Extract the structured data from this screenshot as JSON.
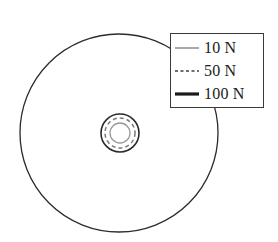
{
  "figure": {
    "background_color": "#ffffff",
    "width": 278,
    "height": 242
  },
  "disc": {
    "name": "outer-disc",
    "center_x": 119,
    "center_y": 133,
    "radius": 99,
    "stroke_color": "#2b2b2b",
    "stroke_width": 1.3,
    "fill": "none"
  },
  "hub": {
    "name": "center-hub",
    "center_x": 120,
    "center_y": 133,
    "rings": [
      {
        "label": "hub-outer-ring",
        "radius": 19,
        "stroke_color": "#2b2b2b",
        "stroke_width": 1.6,
        "dash": "none"
      },
      {
        "label": "hub-dashed-ring",
        "radius": 15,
        "stroke_color": "#7a7a7a",
        "stroke_width": 1.5,
        "dash": "4 3"
      },
      {
        "label": "hub-inner-ring",
        "radius": 10,
        "stroke_color": "#9a9a9a",
        "stroke_width": 1.3,
        "dash": "none"
      }
    ]
  },
  "legend": {
    "name": "force-legend",
    "border_color": "#3a3a3a",
    "background_color": "#ffffff",
    "x": 170,
    "y": 33,
    "width": 94,
    "height": 75,
    "entries": [
      {
        "label": "10 N",
        "value": 10,
        "unit": "N",
        "style": "solid-thin",
        "color": "#8c8c8c",
        "stroke_width": 1.5,
        "dash": "none"
      },
      {
        "label": "50 N",
        "value": 50,
        "unit": "N",
        "style": "dotted",
        "color": "#6f6f6f",
        "stroke_width": 2,
        "dash": "3 2.5"
      },
      {
        "label": "100 N",
        "value": 100,
        "unit": "N",
        "style": "solid-thick",
        "color": "#1a1a1a",
        "stroke_width": 3.2,
        "dash": "none"
      }
    ]
  },
  "chart_data": {
    "type": "line",
    "title": "",
    "xlabel": "",
    "ylabel": "",
    "legend_position": "top-right",
    "grid": false,
    "series": [
      {
        "name": "10 N",
        "value": 10,
        "style": "solid-thin",
        "color": "#8c8c8c"
      },
      {
        "name": "50 N",
        "value": 50,
        "style": "dotted",
        "color": "#6f6f6f"
      },
      {
        "name": "100 N",
        "value": 100,
        "style": "solid-thick",
        "color": "#1a1a1a"
      }
    ],
    "contours": [
      {
        "level": "outer",
        "shape": "circle",
        "cx": 119,
        "cy": 133,
        "r": 99
      },
      {
        "level": "hub-outer",
        "shape": "circle",
        "cx": 120,
        "cy": 133,
        "r": 19
      },
      {
        "level": "hub-middle",
        "shape": "circle",
        "cx": 120,
        "cy": 133,
        "r": 15
      },
      {
        "level": "hub-inner",
        "shape": "circle",
        "cx": 120,
        "cy": 133,
        "r": 10
      }
    ]
  }
}
